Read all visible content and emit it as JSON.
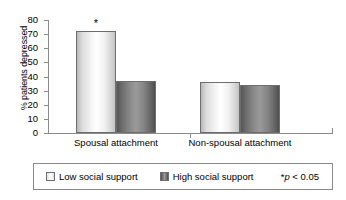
{
  "chart_data": {
    "type": "bar",
    "title": "",
    "subtitle": "",
    "xlabel": "",
    "ylabel": "% patients depressed",
    "ylim": [
      0,
      80
    ],
    "yticks": [
      0,
      10,
      20,
      30,
      40,
      50,
      60,
      70,
      80
    ],
    "ytick_labels": [
      "0",
      "10",
      "20",
      "30",
      "40",
      "50",
      "60",
      "70",
      "80"
    ],
    "grid": false,
    "legend_position": "bottom",
    "categories": [
      "Spousal attachment",
      "Non-spousal attachment"
    ],
    "series": [
      {
        "name": "Low social support",
        "values": [
          72,
          36
        ],
        "color": "#f0f0f0"
      },
      {
        "name": "High social support",
        "values": [
          37,
          34
        ],
        "color": "#7a7a7a"
      }
    ],
    "annotations": [
      {
        "text": "*",
        "series": "Low social support",
        "category": "Spousal attachment",
        "value": 72
      }
    ],
    "legend_note": "p < 0.05",
    "legend_note_prefix": "*",
    "legend_note_symbol": "p",
    "legend_note_rest": " < 0.05"
  },
  "axis": {
    "y_title": "% patients depressed"
  },
  "legend": {
    "entries": [
      {
        "label": "Low social support",
        "swatch": "light-swatch"
      },
      {
        "label": "High social support",
        "swatch": "dark-swatch"
      }
    ],
    "note_star": "*",
    "note_italic": "p",
    "note_tail": " < 0.05"
  }
}
